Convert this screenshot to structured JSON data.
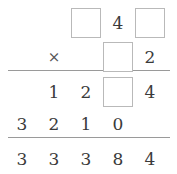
{
  "problem": {
    "type": "long-multiplication",
    "operator": "×",
    "columns": 5,
    "column_centers_px": [
      22,
      54,
      86,
      118,
      150
    ],
    "rows": [
      {
        "name": "multiplicand",
        "y": 8,
        "cells": [
          {
            "col": 0,
            "kind": "empty",
            "value": ""
          },
          {
            "col": 1,
            "kind": "empty",
            "value": ""
          },
          {
            "col": 2,
            "kind": "blank",
            "value": ""
          },
          {
            "col": 3,
            "kind": "digit",
            "value": "4"
          },
          {
            "col": 4,
            "kind": "blank",
            "value": ""
          }
        ]
      },
      {
        "name": "multiplier",
        "y": 42,
        "operator_col": 1,
        "cells": [
          {
            "col": 0,
            "kind": "empty",
            "value": ""
          },
          {
            "col": 1,
            "kind": "operator",
            "value": "×"
          },
          {
            "col": 2,
            "kind": "empty",
            "value": ""
          },
          {
            "col": 3,
            "kind": "blank",
            "value": ""
          },
          {
            "col": 4,
            "kind": "digit",
            "value": "2"
          }
        ]
      },
      {
        "name": "partial-product-1",
        "y": 77,
        "cells": [
          {
            "col": 0,
            "kind": "empty",
            "value": ""
          },
          {
            "col": 1,
            "kind": "digit",
            "value": "1"
          },
          {
            "col": 2,
            "kind": "digit",
            "value": "2"
          },
          {
            "col": 3,
            "kind": "blank",
            "value": ""
          },
          {
            "col": 4,
            "kind": "digit",
            "value": "4"
          }
        ]
      },
      {
        "name": "partial-product-2",
        "y": 109,
        "cells": [
          {
            "col": 0,
            "kind": "digit",
            "value": "3"
          },
          {
            "col": 1,
            "kind": "digit",
            "value": "2"
          },
          {
            "col": 2,
            "kind": "digit",
            "value": "1"
          },
          {
            "col": 3,
            "kind": "digit",
            "value": "0"
          },
          {
            "col": 4,
            "kind": "empty",
            "value": ""
          }
        ]
      },
      {
        "name": "total",
        "y": 144,
        "cells": [
          {
            "col": 0,
            "kind": "digit",
            "value": "3"
          },
          {
            "col": 1,
            "kind": "digit",
            "value": "3"
          },
          {
            "col": 2,
            "kind": "digit",
            "value": "3"
          },
          {
            "col": 3,
            "kind": "digit",
            "value": "8"
          },
          {
            "col": 4,
            "kind": "digit",
            "value": "4"
          }
        ]
      }
    ],
    "rules": [
      {
        "name": "rule-above-partials",
        "y": 70
      },
      {
        "name": "rule-above-total",
        "y": 137
      }
    ],
    "colors": {
      "digit": "#3a3a3a",
      "operator": "#555555",
      "blank_border": "#b9b9b9",
      "rule": "#9a9a9a",
      "background": "#ffffff"
    }
  }
}
